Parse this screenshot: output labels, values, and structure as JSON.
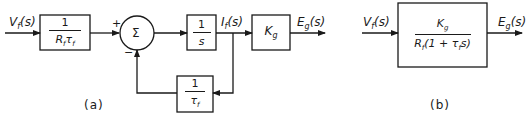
{
  "diagram_a": {
    "caption": "(a)",
    "input_label": "Vf(s)",
    "input_label_main": "V",
    "input_label_sub": "f",
    "input_label_arg": "(s)",
    "gain_block": {
      "numerator": "1",
      "denominator": "Rfτf",
      "den_R": "R",
      "den_sub1": "f",
      "den_tau": "τ",
      "den_sub2": "f"
    },
    "summing_junction": {
      "symbol": "Σ",
      "plus_sign": "+",
      "minus_sign": "−"
    },
    "integrator_block": {
      "numerator": "1",
      "denominator": "s"
    },
    "intermediate_label": "If(s)",
    "intermediate_main": "I",
    "intermediate_sub": "f",
    "intermediate_arg": "(s)",
    "generator_block": {
      "label": "Kg",
      "main": "K",
      "sub": "g"
    },
    "output_label": "Eg(s)",
    "output_main": "E",
    "output_sub": "g",
    "output_arg": "(s)",
    "feedback_block": {
      "numerator": "1",
      "denominator": "τf",
      "den_tau": "τ",
      "den_sub": "f"
    }
  },
  "diagram_b": {
    "caption": "(b)",
    "input_label": "Vf(s)",
    "input_main": "V",
    "input_sub": "f",
    "input_arg": "(s)",
    "transfer_block": {
      "numerator": "Kg",
      "num_main": "K",
      "num_sub": "g",
      "denominator": "Rf(1 + τf s)",
      "den_R": "R",
      "den_sub1": "f",
      "den_mid": "(1 + τ",
      "den_sub2": "f",
      "den_end": "s)"
    },
    "output_label": "Eg(s)",
    "output_main": "E",
    "output_sub": "g",
    "output_arg": "(s)"
  },
  "colors": {
    "ink": "#1a1a1a",
    "background": "#ffffff"
  }
}
